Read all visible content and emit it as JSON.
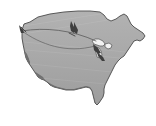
{
  "figure": {
    "name": "united-states-map-with-route-arcs",
    "title": "Map of the contiguous United States",
    "background_color": "#ffffff",
    "width_px": 156,
    "height_px": 126
  },
  "colors": {
    "background": "#ffffff",
    "land_fill": "#a9a9a9",
    "land_fill_shadow": "#9a9a9a",
    "highlight_region_fill": "#6e6e6e",
    "outline_stroke": "#4a4a4a",
    "route_line": "#5a5a5a",
    "marker_fill": "#3f3f3f",
    "lake_fill": "#f2f2f2",
    "lake_stroke": "#555555"
  },
  "legend": {
    "visible": false,
    "entries": []
  },
  "labels": {
    "visible": false,
    "items": []
  },
  "regions": [
    {
      "name": "contiguous-united-states-landmass",
      "role": "base-landmass",
      "fill": "#a9a9a9"
    },
    {
      "name": "southwest-border-highlight",
      "role": "highlighted-area",
      "fill": "#6e6e6e"
    },
    {
      "name": "great-lakes-water",
      "role": "water-body",
      "fill": "#f2f2f2"
    }
  ],
  "routes": [
    {
      "name": "route-arc-upper",
      "style": "thin-solid-line",
      "origin": "pacific-northwest-coast",
      "destination": "great-lakes-region",
      "curvature": "slight"
    },
    {
      "name": "route-arc-lower",
      "style": "thin-solid-line",
      "origin": "pacific-northwest-coast",
      "destination": "great-lakes-region",
      "curvature": "pronounced-downward"
    }
  ],
  "markers": [
    {
      "name": "marker-west-endpoint",
      "shape": "arrow-cluster",
      "fill": "#3f3f3f",
      "location": "pacific-northwest-coast"
    },
    {
      "name": "marker-north-central",
      "shape": "arrow-cluster",
      "fill": "#3f3f3f",
      "location": "north-central-plains"
    },
    {
      "name": "marker-great-lakes-endpoint",
      "shape": "arrow-cluster",
      "fill": "#3f3f3f",
      "location": "great-lakes-region"
    }
  ]
}
